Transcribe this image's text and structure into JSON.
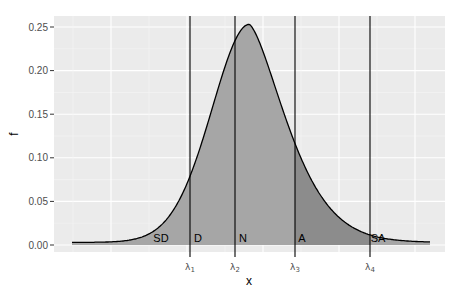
{
  "chart_data": {
    "type": "area",
    "title": "",
    "xlabel": "x",
    "ylabel": "f",
    "ylim": [
      -0.008,
      0.262
    ],
    "y_ticks": [
      "0.00",
      "0.05",
      "0.10",
      "0.15",
      "0.20",
      "0.25"
    ],
    "y_tick_values": [
      0,
      0.05,
      0.1,
      0.15,
      0.2,
      0.25
    ],
    "grid": true,
    "curve": {
      "description": "density curve, peak ~0.25",
      "peak_f": 0.25,
      "x_start_px": 72,
      "x_end_px": 430
    },
    "thresholds": [
      {
        "label": "λ1",
        "sub": "1",
        "x_px": 190
      },
      {
        "label": "λ2",
        "sub": "2",
        "x_px": 235
      },
      {
        "label": "λ3",
        "sub": "3",
        "x_px": 295
      },
      {
        "label": "λ4",
        "sub": "4",
        "x_px": 370
      }
    ],
    "regions": [
      {
        "label": "SD",
        "shade": "#a6a6a6"
      },
      {
        "label": "D",
        "shade": "#a6a6a6"
      },
      {
        "label": "N",
        "shade": "#a6a6a6"
      },
      {
        "label": "A",
        "shade": "#8c8c8c"
      },
      {
        "label": "SA",
        "shade": "#a6a6a6"
      }
    ]
  },
  "axis": {
    "x_title": "x",
    "y_title": "f"
  },
  "region_labels": [
    "SD",
    "D",
    "N",
    "A",
    "SA"
  ]
}
